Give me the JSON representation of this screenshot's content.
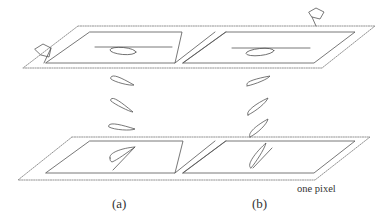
{
  "figure": {
    "type": "schematic",
    "colors": {
      "stroke": "#555555",
      "dotted_stroke": "#777777",
      "background": "#ffffff"
    },
    "labels": {
      "panel_a": "(a)",
      "panel_b": "(b)",
      "annotation": "one pixel"
    },
    "icons": {
      "left_marker": "flag-icon",
      "right_marker": "flag-icon"
    },
    "top_plane": {
      "outer_border": "dotted",
      "panels": [
        {
          "id": "a",
          "has_horizontal_line": true,
          "shape": "flat-ellipse"
        },
        {
          "id": "b",
          "has_horizontal_line": true,
          "shape": "flat-ellipse"
        }
      ]
    },
    "bottom_plane": {
      "outer_border": "dotted",
      "panels": [
        {
          "id": "a",
          "shape": "tilted-leaf-with-stem"
        },
        {
          "id": "b",
          "shape": "steep-leaf-with-stem"
        }
      ]
    },
    "falling_shapes": {
      "a": 3,
      "b": 3
    }
  }
}
